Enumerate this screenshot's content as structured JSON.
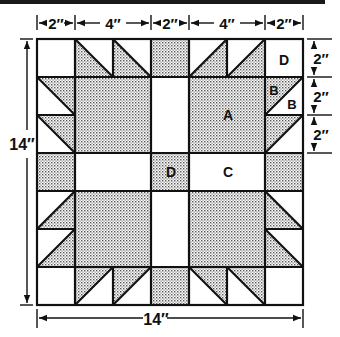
{
  "diagram": {
    "type": "quilt-block-pattern",
    "block_size": "14″",
    "colors": {
      "line": "#111111",
      "shade": "#c8c8c8",
      "background": "#ffffff"
    },
    "top_dimensions": [
      "2″",
      "4″",
      "2″",
      "4″",
      "2″"
    ],
    "right_dimensions": [
      "2″",
      "2″",
      "2″"
    ],
    "left_dimension": "14″",
    "bottom_dimension": "14″",
    "piece_labels": {
      "A": "A",
      "B1": "B",
      "B2": "B",
      "C": "C",
      "D_corner": "D",
      "D_center": "D"
    }
  }
}
